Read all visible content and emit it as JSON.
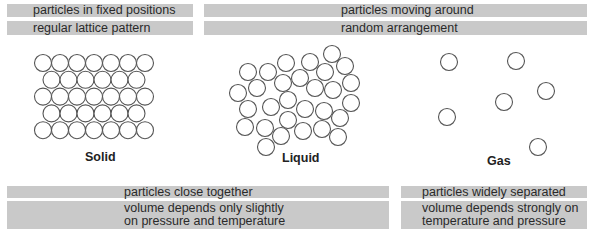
{
  "top_left": {
    "line1": "particles in fixed positions",
    "line2": "regular lattice pattern"
  },
  "top_right": {
    "line1": "particles moving around",
    "line2": "random arrangement"
  },
  "states": {
    "solid": "Solid",
    "liquid": "Liquid",
    "gas": "Gas"
  },
  "bottom_left": {
    "line1": "particles close together",
    "line2a": "volume depends only slightly",
    "line2b": "on pressure and temperature"
  },
  "bottom_right": {
    "line1": "particles widely separated",
    "line2a": "volume depends strongly on",
    "line2b": "temperature and pressure"
  },
  "colors": {
    "bar": "#c9c9c9",
    "circle_stroke": "#555555",
    "text": "#2a2a2a"
  },
  "particles": {
    "radius": 8.5,
    "solid_rows": [
      7,
      6,
      7,
      6,
      7
    ],
    "liquid": [
      [
        248,
        72
      ],
      [
        268,
        72
      ],
      [
        286,
        63
      ],
      [
        310,
        62
      ],
      [
        332,
        54
      ],
      [
        345,
        66
      ],
      [
        325,
        72
      ],
      [
        300,
        78
      ],
      [
        283,
        83
      ],
      [
        257,
        88
      ],
      [
        238,
        93
      ],
      [
        315,
        88
      ],
      [
        333,
        90
      ],
      [
        351,
        83
      ],
      [
        288,
        100
      ],
      [
        271,
        107
      ],
      [
        248,
        109
      ],
      [
        305,
        109
      ],
      [
        324,
        111
      ],
      [
        351,
        103
      ],
      [
        288,
        120
      ],
      [
        245,
        127
      ],
      [
        265,
        128
      ],
      [
        281,
        136
      ],
      [
        303,
        131
      ],
      [
        322,
        129
      ],
      [
        340,
        118
      ],
      [
        338,
        137
      ],
      [
        266,
        147
      ]
    ],
    "gas": [
      [
        449,
        62
      ],
      [
        516,
        61
      ],
      [
        546,
        91
      ],
      [
        504,
        102
      ],
      [
        447,
        117
      ],
      [
        538,
        147
      ]
    ]
  }
}
